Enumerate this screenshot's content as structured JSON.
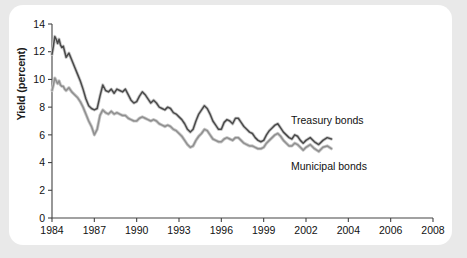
{
  "figure": {
    "background": "#ffffff",
    "outer_background": "#e9e9e9"
  },
  "axis": {
    "ylabel": "Yield (percent)",
    "ytick_labels": [
      "0",
      "2",
      "4",
      "6",
      "8",
      "10",
      "12",
      "14"
    ],
    "xtick_labels": [
      "1984",
      "1987",
      "1990",
      "1993",
      "1996",
      "1999",
      "2002",
      "2004",
      "2006",
      "2008"
    ]
  },
  "annotations": {
    "treasury": "Treasury bonds",
    "municipal": "Municipal bonds"
  },
  "chart_data": {
    "type": "line",
    "title": "",
    "xlabel": "",
    "ylabel": "Yield (percent)",
    "ylim": [
      0,
      14
    ],
    "yticks": [
      0,
      2,
      4,
      6,
      8,
      10,
      12,
      14
    ],
    "xticks": [
      1984,
      1987,
      1990,
      1993,
      1996,
      1999,
      2002,
      2004,
      2006,
      2008
    ],
    "xlim": [
      1984,
      2008
    ],
    "grid": false,
    "legend": "inline annotations at right of curves",
    "colors": {
      "treasury": "#4a4a4a",
      "municipal": "#8f8f8f"
    },
    "series": [
      {
        "name": "Treasury bonds",
        "color": "#4a4a4a",
        "x": [
          1984.0,
          1984.1,
          1984.2,
          1984.3,
          1984.4,
          1984.5,
          1984.6,
          1984.7,
          1984.8,
          1984.9,
          1985.0,
          1985.2,
          1985.4,
          1985.6,
          1985.8,
          1986.0,
          1986.2,
          1986.4,
          1986.6,
          1986.8,
          1987.0,
          1987.2,
          1987.4,
          1987.6,
          1987.8,
          1988.0,
          1988.2,
          1988.4,
          1988.6,
          1988.8,
          1989.0,
          1989.2,
          1989.4,
          1989.6,
          1989.8,
          1990.0,
          1990.2,
          1990.4,
          1990.6,
          1990.8,
          1991.0,
          1991.2,
          1991.4,
          1991.6,
          1991.8,
          1992.0,
          1992.2,
          1992.4,
          1992.6,
          1992.8,
          1993.0,
          1993.2,
          1993.4,
          1993.6,
          1993.8,
          1994.0,
          1994.2,
          1994.4,
          1994.6,
          1994.8,
          1995.0,
          1995.2,
          1995.4,
          1995.6,
          1995.8,
          1996.0,
          1996.2,
          1996.4,
          1996.6,
          1996.8,
          1997.0,
          1997.2,
          1997.4,
          1997.6,
          1997.8,
          1998.0,
          1998.2,
          1998.4,
          1998.6,
          1998.8,
          1999.0,
          1999.2,
          1999.4,
          1999.6,
          1999.8,
          2000.0,
          2000.2,
          2000.4,
          2000.6,
          2000.8,
          2001.0,
          2001.2,
          2001.4,
          2001.6,
          2001.8,
          2002.0,
          2002.2,
          2002.4,
          2002.6,
          2002.8,
          2003.0,
          2003.2
        ],
        "y": [
          11.8,
          12.4,
          13.1,
          12.9,
          12.6,
          12.9,
          12.5,
          12.3,
          12.4,
          12.0,
          11.6,
          11.9,
          11.4,
          10.9,
          10.4,
          9.9,
          9.3,
          8.6,
          8.1,
          7.9,
          7.8,
          7.9,
          8.8,
          9.6,
          9.2,
          9.1,
          9.3,
          9.0,
          9.3,
          9.2,
          9.1,
          9.3,
          8.9,
          8.5,
          8.3,
          8.4,
          8.8,
          9.1,
          8.9,
          8.6,
          8.3,
          8.5,
          8.3,
          8.0,
          7.9,
          7.8,
          8.0,
          7.9,
          7.6,
          7.5,
          7.3,
          7.1,
          6.8,
          6.4,
          6.2,
          6.4,
          7.0,
          7.5,
          7.8,
          8.1,
          7.9,
          7.5,
          7.0,
          6.7,
          6.4,
          6.4,
          6.9,
          7.1,
          7.0,
          6.8,
          7.2,
          7.2,
          6.9,
          6.6,
          6.4,
          6.2,
          6.1,
          5.8,
          5.6,
          5.5,
          5.6,
          6.0,
          6.3,
          6.5,
          6.7,
          6.8,
          6.5,
          6.2,
          6.0,
          5.8,
          5.7,
          6.0,
          5.9,
          5.6,
          5.4,
          5.6,
          5.8,
          5.5,
          5.3,
          5.6,
          5.8,
          5.7
        ]
      },
      {
        "name": "Municipal bonds",
        "color": "#8f8f8f",
        "x": [
          1984.0,
          1984.1,
          1984.2,
          1984.3,
          1984.4,
          1984.5,
          1984.6,
          1984.7,
          1984.8,
          1984.9,
          1985.0,
          1985.2,
          1985.4,
          1985.6,
          1985.8,
          1986.0,
          1986.2,
          1986.4,
          1986.6,
          1986.8,
          1987.0,
          1987.2,
          1987.4,
          1987.6,
          1987.8,
          1988.0,
          1988.2,
          1988.4,
          1988.6,
          1988.8,
          1989.0,
          1989.2,
          1989.4,
          1989.6,
          1989.8,
          1990.0,
          1990.2,
          1990.4,
          1990.6,
          1990.8,
          1991.0,
          1991.2,
          1991.4,
          1991.6,
          1991.8,
          1992.0,
          1992.2,
          1992.4,
          1992.6,
          1992.8,
          1993.0,
          1993.2,
          1993.4,
          1993.6,
          1993.8,
          1994.0,
          1994.2,
          1994.4,
          1994.6,
          1994.8,
          1995.0,
          1995.2,
          1995.4,
          1995.6,
          1995.8,
          1996.0,
          1996.2,
          1996.4,
          1996.6,
          1996.8,
          1997.0,
          1997.2,
          1997.4,
          1997.6,
          1997.8,
          1998.0,
          1998.2,
          1998.4,
          1998.6,
          1998.8,
          1999.0,
          1999.2,
          1999.4,
          1999.6,
          1999.8,
          2000.0,
          2000.2,
          2000.4,
          2000.6,
          2000.8,
          2001.0,
          2001.2,
          2001.4,
          2001.6,
          2001.8,
          2002.0,
          2002.2,
          2002.4,
          2002.6,
          2002.8,
          2003.0,
          2003.2
        ],
        "y": [
          9.2,
          9.6,
          10.1,
          9.9,
          9.7,
          9.9,
          9.6,
          9.5,
          9.5,
          9.3,
          9.2,
          9.4,
          9.1,
          8.9,
          8.7,
          8.4,
          8.0,
          7.5,
          7.0,
          6.6,
          6.0,
          6.4,
          7.4,
          7.8,
          7.6,
          7.5,
          7.7,
          7.5,
          7.6,
          7.5,
          7.4,
          7.4,
          7.2,
          7.1,
          7.0,
          7.0,
          7.2,
          7.3,
          7.2,
          7.1,
          7.0,
          7.1,
          7.0,
          6.8,
          6.7,
          6.6,
          6.7,
          6.6,
          6.4,
          6.3,
          6.1,
          5.9,
          5.6,
          5.3,
          5.1,
          5.2,
          5.6,
          5.9,
          6.1,
          6.4,
          6.3,
          6.0,
          5.7,
          5.6,
          5.5,
          5.5,
          5.7,
          5.8,
          5.7,
          5.6,
          5.8,
          5.8,
          5.6,
          5.4,
          5.3,
          5.2,
          5.2,
          5.1,
          5.0,
          5.0,
          5.1,
          5.4,
          5.6,
          5.8,
          6.0,
          6.1,
          5.9,
          5.6,
          5.4,
          5.2,
          5.2,
          5.4,
          5.3,
          5.1,
          4.9,
          5.1,
          5.3,
          5.0,
          4.8,
          5.1,
          5.2,
          5.0
        ]
      }
    ]
  }
}
